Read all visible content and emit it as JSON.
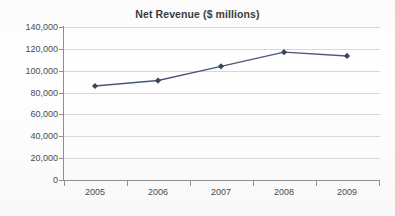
{
  "chart_data": {
    "type": "line",
    "title": "Net Revenue ($ millions)",
    "xlabel": "",
    "ylabel": "",
    "categories": [
      "2005",
      "2006",
      "2007",
      "2008",
      "2009"
    ],
    "values": [
      86000,
      91000,
      104000,
      117000,
      113500
    ],
    "series": [
      {
        "name": "Net Revenue",
        "values": [
          86000,
          91000,
          104000,
          117000,
          113500
        ]
      }
    ],
    "ylim": [
      0,
      140000
    ],
    "ytick_labels": [
      "0",
      "20,000",
      "40,000",
      "60,000",
      "80,000",
      "100,000",
      "120,000",
      "140,000"
    ],
    "ytick_values": [
      0,
      20000,
      40000,
      60000,
      80000,
      100000,
      120000,
      140000
    ],
    "grid": true,
    "legend": false,
    "marker": "diamond",
    "colors": {
      "line": "#4a5878",
      "marker": "#3a4663",
      "grid": "#d6d8dc",
      "axis": "#8d8f93",
      "text": "#4c4c4c",
      "title": "#3b3b3b",
      "background": "#fdfdfd"
    }
  }
}
